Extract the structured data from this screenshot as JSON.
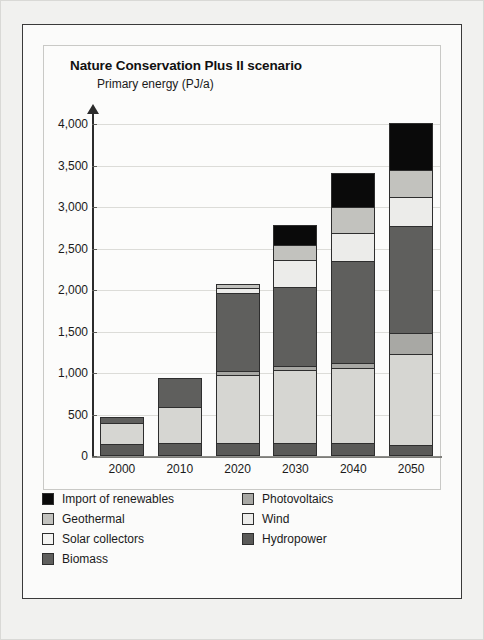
{
  "figure": {
    "title": "Nature Conservation Plus II scenario",
    "y_axis_label": "Primary energy (PJ/a)"
  },
  "chart_data": {
    "type": "bar",
    "stacked": true,
    "title": "Nature Conservation Plus II scenario",
    "xlabel": "",
    "ylabel": "Primary energy (PJ/a)",
    "ylim": [
      0,
      4000
    ],
    "yticks": [
      "0",
      "500",
      "1,000",
      "1,500",
      "2,000",
      "2,500",
      "3,000",
      "3,500",
      "4,000"
    ],
    "ytick_values": [
      0,
      500,
      1000,
      1500,
      2000,
      2500,
      3000,
      3500,
      4000
    ],
    "grid": true,
    "legend_position": "below-plot",
    "categories": [
      "2000",
      "2010",
      "2020",
      "2030",
      "2040",
      "2050"
    ],
    "stack_order_bottom_to_top": [
      "Hydropower",
      "Biomass",
      "Photovoltaics",
      "Solar collectors",
      "Wind",
      "Geothermal",
      "Import of renewables"
    ],
    "series": [
      {
        "name": "Hydropower",
        "color": "#5a5a58",
        "values": [
          150,
          155,
          160,
          160,
          155,
          135
        ]
      },
      {
        "name": "Biomass",
        "color": "#d6d6d2",
        "values": [
          250,
          440,
          820,
          880,
          900,
          1090
        ]
      },
      {
        "name": "Photovoltaics",
        "color": "#a8a8a4",
        "values": [
          0,
          0,
          40,
          40,
          60,
          260
        ]
      },
      {
        "name": "Solar collectors",
        "color": "#5f5f5d",
        "values": [
          70,
          340,
          940,
          960,
          1230,
          1290
        ]
      },
      {
        "name": "Wind",
        "color": "#ececea",
        "values": [
          0,
          0,
          60,
          320,
          340,
          340
        ]
      },
      {
        "name": "Geothermal",
        "color": "#c2c2be",
        "values": [
          0,
          0,
          50,
          180,
          310,
          330
        ]
      },
      {
        "name": "Import of renewables",
        "color": "#0a0a0a",
        "values": [
          0,
          0,
          0,
          240,
          410,
          570
        ]
      }
    ],
    "totals": [
      470,
      935,
      2070,
      2780,
      3405,
      4015
    ]
  },
  "legend": {
    "items": [
      {
        "label": "Import of renewables",
        "color": "#0a0a0a",
        "column": "left",
        "row": 0
      },
      {
        "label": "Geothermal",
        "color": "#c2c2be",
        "column": "left",
        "row": 1
      },
      {
        "label": "Solar collectors",
        "color": "#f4f4f2",
        "column": "left",
        "row": 2
      },
      {
        "label": "Biomass",
        "color": "#5f5f5d",
        "column": "left",
        "row": 3
      },
      {
        "label": "Photovoltaics",
        "color": "#a8a8a4",
        "column": "right",
        "row": 0
      },
      {
        "label": "Wind",
        "color": "#ececea",
        "column": "right",
        "row": 1
      },
      {
        "label": "Hydropower",
        "color": "#5a5a58",
        "column": "right",
        "row": 2
      }
    ]
  }
}
